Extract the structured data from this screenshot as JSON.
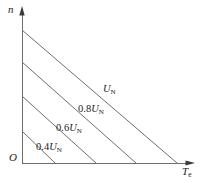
{
  "figure": {
    "background_color": "#ffffff",
    "line_color": "#6e6e6e",
    "axis_color": "#6e6e6e",
    "text_color": "#1c1c1c"
  },
  "axes": {
    "y": {
      "label_main": "n",
      "label_sub": "",
      "name": "speed-axis"
    },
    "x": {
      "label_main": "T",
      "label_sub": "e",
      "name": "torque-axis"
    },
    "origin": {
      "label": "O"
    }
  },
  "curves": [
    {
      "label_prefix": "",
      "label_main": "U",
      "label_sub": "N",
      "full_label": "UN"
    },
    {
      "label_prefix": "0.8",
      "label_main": "U",
      "label_sub": "N",
      "full_label": "0.8UN"
    },
    {
      "label_prefix": "0.6",
      "label_main": "U",
      "label_sub": "N",
      "full_label": "0.6UN"
    },
    {
      "label_prefix": "0.4",
      "label_main": "U",
      "label_sub": "N",
      "full_label": "0.4UN"
    }
  ],
  "chart_data": {
    "type": "line",
    "title": "",
    "xlabel": "Te",
    "ylabel": "n",
    "xlim": [
      0,
      1
    ],
    "ylim": [
      0,
      1
    ],
    "grid": false,
    "legend": "inline-curve-labels",
    "series": [
      {
        "name": "UN",
        "x": [
          0.0,
          1.0
        ],
        "y": [
          1.0,
          0.0
        ],
        "pixel_start": [
          22,
          30
        ],
        "pixel_end": [
          177,
          163
        ]
      },
      {
        "name": "0.8UN",
        "x": [
          0.0,
          0.75
        ],
        "y": [
          0.76,
          0.0
        ],
        "pixel_start": [
          22,
          62
        ],
        "pixel_end": [
          136,
          163
        ]
      },
      {
        "name": "0.6UN",
        "x": [
          0.0,
          0.48
        ],
        "y": [
          0.5,
          0.0
        ],
        "pixel_start": [
          22,
          96
        ],
        "pixel_end": [
          96,
          163
        ]
      },
      {
        "name": "0.4UN",
        "x": [
          0.0,
          0.21
        ],
        "y": [
          0.24,
          0.0
        ],
        "pixel_start": [
          22,
          131
        ],
        "pixel_end": [
          55,
          163
        ]
      }
    ]
  }
}
